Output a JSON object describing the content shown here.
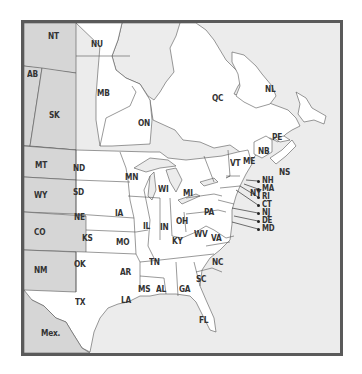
{
  "map": {
    "colors": {
      "us_canada_land": "#ffffff",
      "shaded_land": "#d6d6d6",
      "water": "#ececec",
      "border": "#555555",
      "frame": "#5a5a5a"
    },
    "shaded_regions": [
      "NT",
      "AB",
      "SK",
      "MT",
      "WY",
      "CO",
      "NM",
      "Mex."
    ],
    "labels": {
      "NT": "NT",
      "NU": "NU",
      "AB": "AB",
      "SK": "SK",
      "MB": "MB",
      "ON": "ON",
      "QC": "QC",
      "NL": "NL",
      "PE": "PE",
      "NB": "NB",
      "NS": "NS",
      "MT": "MT",
      "WY": "WY",
      "CO": "CO",
      "NM": "NM",
      "ND": "ND",
      "SD": "SD",
      "NE": "NE",
      "KS": "KS",
      "OK": "OK",
      "TX": "TX",
      "MN": "MN",
      "IA": "IA",
      "MO": "MO",
      "AR": "AR",
      "LA": "LA",
      "WI": "WI",
      "IL": "IL",
      "MI": "MI",
      "IN": "IN",
      "OH": "OH",
      "KY": "KY",
      "TN": "TN",
      "MS": "MS",
      "AL": "AL",
      "GA": "GA",
      "FL": "FL",
      "SC": "SC",
      "NC": "NC",
      "VA": "VA",
      "WV": "WV",
      "PA": "PA",
      "NY": "NY",
      "VT": "VT",
      "ME": "ME",
      "NH": "NH",
      "MA": "MA",
      "RI": "RI",
      "CT": "CT",
      "NJ": "NJ",
      "DE": "DE",
      "MD": "MD",
      "Mex": "Mex."
    }
  }
}
